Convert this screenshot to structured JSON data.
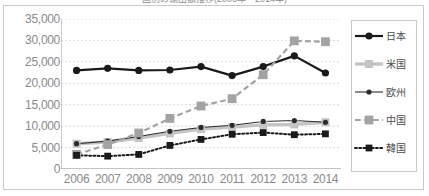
{
  "title_partial": "国別の輸出額推移(2006年〜2014年)",
  "chart_data": {
    "type": "line",
    "title": "",
    "xlabel": "",
    "ylabel": "",
    "categories": [
      "2006",
      "2007",
      "2008",
      "2009",
      "2010",
      "2011",
      "2012",
      "2013",
      "2014"
    ],
    "ylim": [
      0,
      35000
    ],
    "ytick_values": [
      0,
      5000,
      10000,
      15000,
      20000,
      25000,
      30000,
      35000
    ],
    "ytick_labels": [
      "0",
      "5,000",
      "10,000",
      "15,000",
      "20,000",
      "25,000",
      "30,000",
      "35,000"
    ],
    "grid": true,
    "legend_position": "right",
    "series": [
      {
        "name": "日本",
        "color": "#1a1a1a",
        "style": "solid",
        "marker": "circle",
        "width": 2.2,
        "marker_size": 3.6,
        "values": [
          23000,
          23500,
          23000,
          23100,
          23900,
          21800,
          23900,
          26400,
          22400
        ]
      },
      {
        "name": "米国",
        "color": "#c4c4c4",
        "style": "solid",
        "marker": "square",
        "width": 3.4,
        "marker_size": 4.0,
        "values": [
          5900,
          6300,
          7200,
          8300,
          9300,
          9800,
          10300,
          10400,
          10900
        ]
      },
      {
        "name": "欧州",
        "color": "#2b2b2b",
        "style": "solid",
        "marker": "circle",
        "width": 1.1,
        "marker_size": 2.6,
        "values": [
          5900,
          6500,
          7600,
          8800,
          9700,
          10200,
          11100,
          11300,
          10900
        ]
      },
      {
        "name": "中国",
        "color": "#a3a3a3",
        "style": "dashed",
        "marker": "square",
        "width": 2.2,
        "marker_size": 4.4,
        "values": [
          3400,
          5700,
          8400,
          11800,
          14700,
          16400,
          22000,
          29900,
          29700
        ]
      },
      {
        "name": "韓国",
        "color": "#1a1a1a",
        "style": "dotted",
        "marker": "square",
        "width": 2.0,
        "marker_size": 3.4,
        "values": [
          3200,
          3000,
          3400,
          5500,
          6900,
          8100,
          8500,
          8000,
          8200
        ]
      }
    ]
  },
  "legend": {
    "items": [
      {
        "label": "日本"
      },
      {
        "label": "米国"
      },
      {
        "label": "欧州"
      },
      {
        "label": "中国"
      },
      {
        "label": "韓国"
      }
    ]
  },
  "colors": {
    "frame": "#c9c9c9",
    "grid": "#d8d8d8",
    "axis": "#9a9a9a",
    "tick_text": "#8a8a8a",
    "legend_text": "#4a4a4a",
    "background": "#ffffff"
  }
}
